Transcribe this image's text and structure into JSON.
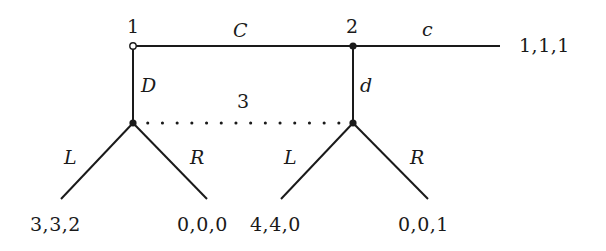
{
  "diagram": {
    "type": "extensive-form game tree",
    "players": {
      "node1": "1",
      "node2": "2",
      "info_set": "3"
    },
    "actions": {
      "player1_continue": "C",
      "player1_down": "D",
      "player2_continue": "c",
      "player2_down": "d",
      "player3_left_a": "L",
      "player3_right_a": "R",
      "player3_left_b": "L",
      "player3_right_b": "R"
    },
    "payoffs": {
      "end_cc": "1,1,1",
      "D_L": "3,3,2",
      "D_R": "0,0,0",
      "Cd_L": "4,4,0",
      "Cd_R": "0,0,1"
    },
    "colors": {
      "line": "#1a1a1a",
      "background": "#ffffff"
    }
  }
}
